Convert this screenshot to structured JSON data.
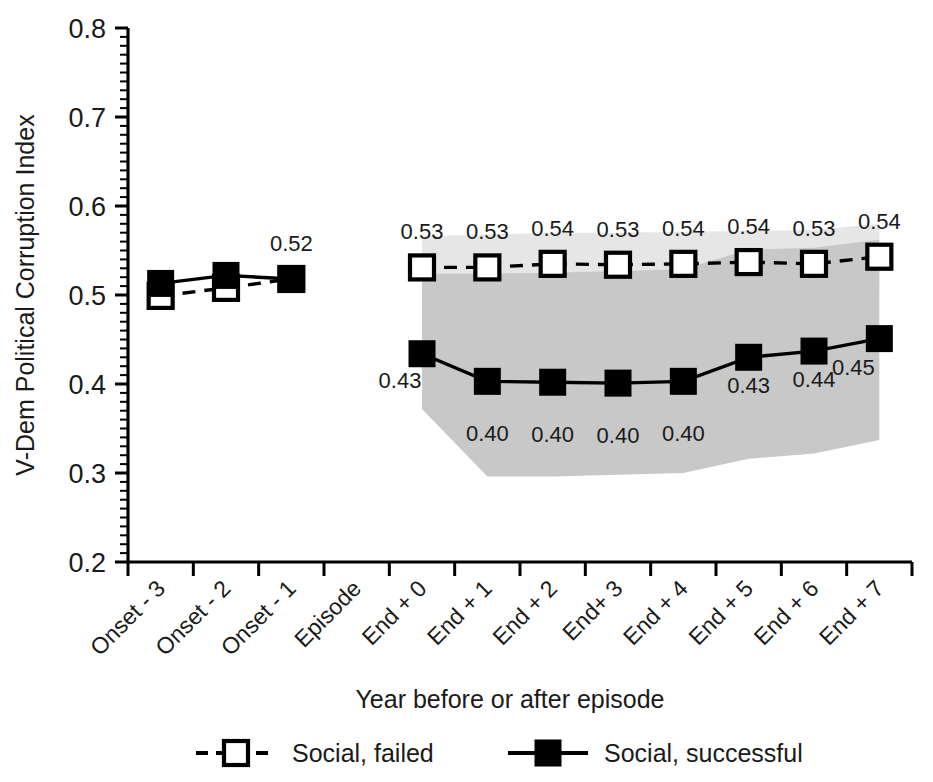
{
  "chart_data": {
    "type": "line",
    "title": "",
    "xlabel": "Year before or after episode",
    "ylabel": "V-Dem Political Corruption Index",
    "ylim": [
      0.2,
      0.8
    ],
    "ytick_labels": [
      "0.8",
      "0.7",
      "0.6",
      "0.5",
      "0.4",
      "0.3",
      "0.2"
    ],
    "yticks": [
      0.8,
      0.7,
      0.6,
      0.5,
      0.4,
      0.3,
      0.2
    ],
    "minor_ticks_per_interval": 10,
    "grid": false,
    "legend_position": "bottom",
    "categories": [
      "Onset - 3",
      "Onset - 2",
      "Onset - 1",
      "Episode",
      "End + 0",
      "End + 1",
      "End + 2",
      "End+ 3",
      "End + 4",
      "End + 5",
      "End + 6",
      "End + 7"
    ],
    "series": [
      {
        "name": "Social, failed",
        "marker": "open-square",
        "line_style": "dashed",
        "color": "#000000",
        "values": [
          0.499,
          0.508,
          0.518,
          null,
          0.531,
          0.531,
          0.535,
          0.534,
          0.535,
          0.537,
          0.535,
          0.543
        ],
        "labels": [
          "",
          "",
          "",
          "",
          "0.53",
          "0.53",
          "0.54",
          "0.53",
          "0.54",
          "0.54",
          "0.53",
          "0.54"
        ],
        "band_color": "#e6e6e6",
        "band_upper": [
          null,
          null,
          null,
          null,
          0.566,
          0.568,
          0.57,
          0.57,
          0.571,
          0.572,
          0.573,
          0.58
        ],
        "band_lower": [
          null,
          null,
          null,
          null,
          0.506,
          0.505,
          0.503,
          0.502,
          0.502,
          0.502,
          0.501,
          0.505
        ]
      },
      {
        "name": "Social, successful",
        "marker": "filled-square",
        "line_style": "solid",
        "color": "#000000",
        "values": [
          0.513,
          0.522,
          0.518,
          null,
          0.434,
          0.403,
          0.402,
          0.401,
          0.403,
          0.43,
          0.437,
          0.451
        ],
        "labels": [
          "",
          "",
          "0.52",
          "",
          "0.43",
          "0.40",
          "0.40",
          "0.40",
          "0.40",
          "0.43",
          "0.44",
          "0.45"
        ],
        "band_color": "#c8c8c8",
        "band_upper": [
          null,
          null,
          null,
          null,
          0.524,
          0.524,
          0.525,
          0.527,
          0.529,
          0.551,
          0.553,
          0.562
        ],
        "band_lower": [
          null,
          null,
          null,
          null,
          0.372,
          0.296,
          0.296,
          0.298,
          0.3,
          0.316,
          0.322,
          0.337
        ]
      }
    ]
  },
  "legend": {
    "items": [
      {
        "label": "Social, failed"
      },
      {
        "label": "Social, successful"
      }
    ]
  }
}
